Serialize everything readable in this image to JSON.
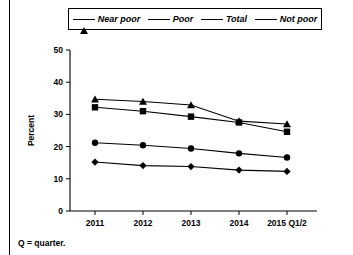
{
  "chart_data": {
    "type": "line",
    "title": "",
    "xlabel": "",
    "ylabel": "Percent",
    "categories": [
      "2011",
      "2012",
      "2013",
      "2014",
      "2015 Q1/2"
    ],
    "ylim": [
      0,
      50
    ],
    "yticks": [
      0,
      10,
      20,
      30,
      40,
      50
    ],
    "grid": false,
    "legend_position": "top",
    "series": [
      {
        "name": "Near poor",
        "marker": "triangle",
        "values": [
          34.7,
          34.0,
          32.9,
          27.9,
          27.0
        ]
      },
      {
        "name": "Poor",
        "marker": "square",
        "values": [
          32.2,
          31.0,
          29.3,
          27.5,
          24.6
        ]
      },
      {
        "name": "Total",
        "marker": "circle",
        "values": [
          21.2,
          20.4,
          19.4,
          17.9,
          16.6
        ]
      },
      {
        "name": "Not poor",
        "marker": "diamond",
        "values": [
          15.2,
          14.1,
          13.8,
          12.7,
          12.3
        ]
      }
    ]
  },
  "legend": {
    "items": [
      {
        "label": "Near poor",
        "marker": "triangle"
      },
      {
        "label": "Poor",
        "marker": "square"
      },
      {
        "label": "Total",
        "marker": "circle"
      },
      {
        "label": "Not poor",
        "marker": "diamond"
      }
    ]
  },
  "axes": {
    "y_title": "Percent",
    "y_ticks": [
      "50",
      "40",
      "30",
      "20",
      "10",
      "0"
    ],
    "x_ticks": [
      "2011",
      "2012",
      "2013",
      "2014",
      "2015 Q1/2"
    ]
  },
  "footnote": {
    "text": "Q = quarter."
  },
  "colors": {
    "ink": "#000000",
    "background": "#ffffff"
  }
}
